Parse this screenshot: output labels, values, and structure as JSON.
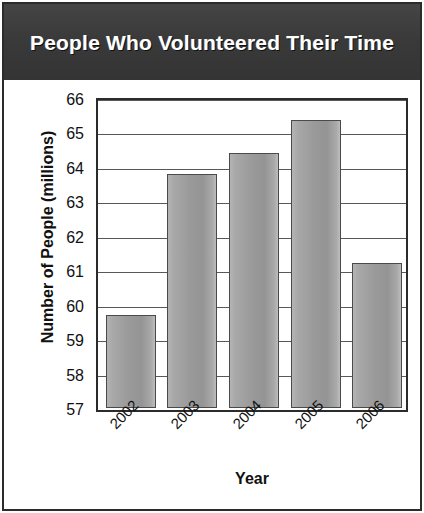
{
  "figure": {
    "title": "People Who Volunteered Their Time"
  },
  "chart_data": {
    "type": "bar",
    "title": "People Who Volunteered Their Time",
    "xlabel": "Year",
    "ylabel": "Number of People (millions)",
    "categories": [
      "2002",
      "2003",
      "2004",
      "2005",
      "2006"
    ],
    "values": [
      59.7,
      63.8,
      64.4,
      65.35,
      61.2
    ],
    "ylim": [
      57,
      66
    ],
    "yticks": [
      66,
      65,
      64,
      63,
      62,
      61,
      60,
      59,
      58,
      57
    ],
    "grid": true,
    "legend": "none",
    "bar_color": "#9a9a9a",
    "bar_edge_color": "#4a4a4a",
    "title_bar_color": "#3a3a3a",
    "title_text_color": "#ffffff"
  }
}
